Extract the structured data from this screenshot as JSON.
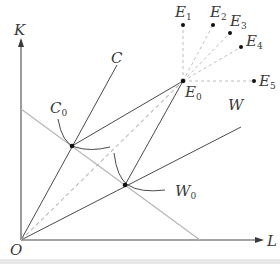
{
  "diagram": {
    "axes": {
      "y_label": "K",
      "x_label": "L",
      "origin_label": "O"
    },
    "rays": [
      {
        "id": "C",
        "label": "C"
      },
      {
        "id": "W",
        "label": "W"
      }
    ],
    "points": [
      {
        "id": "C0",
        "label": "C",
        "sub": "0"
      },
      {
        "id": "W0",
        "label": "W",
        "sub": "0"
      },
      {
        "id": "E0",
        "label": "E",
        "sub": "0"
      },
      {
        "id": "E1",
        "label": "E",
        "sub": "1"
      },
      {
        "id": "E2",
        "label": "E",
        "sub": "2"
      },
      {
        "id": "E3",
        "label": "E",
        "sub": "3"
      },
      {
        "id": "E4",
        "label": "E",
        "sub": "4"
      },
      {
        "id": "E5",
        "label": "E",
        "sub": "5"
      }
    ],
    "colors": {
      "line": "#4a4a4a",
      "budget_line": "#b5b5b5",
      "dashed": "#bdbdbd",
      "point": "#111111"
    }
  }
}
